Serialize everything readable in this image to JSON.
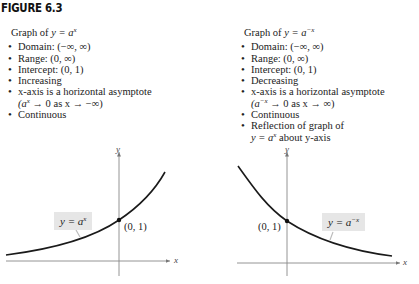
{
  "figure": {
    "title": "FIGURE 6.3"
  },
  "left_panel": {
    "heading_prefix": "Graph of ",
    "heading_eq": "y = a",
    "heading_exp": "x",
    "properties": [
      "Domain:  (−∞, ∞)",
      "Range:  (0, ∞)",
      "Intercept:  (0, 1)",
      "Increasing",
      "x-axis is a horizontal asymptote"
    ],
    "asymptote_note_base": "(a",
    "asymptote_note_exp": "x",
    "asymptote_note_rest": " → 0 as x → −∞)",
    "extra": [
      "Continuous"
    ],
    "graph": {
      "curve_label_eq": "y = a",
      "curve_label_exp": "x",
      "point_label": "(0, 1)",
      "x_axis_label": "x",
      "y_axis_label": "y"
    }
  },
  "right_panel": {
    "heading_prefix": "Graph of ",
    "heading_eq": "y = a",
    "heading_exp": "−x",
    "properties": [
      "Domain:  (−∞, ∞)",
      "Range:  (0, ∞)",
      "Intercept:  (0, 1)",
      "Decreasing",
      "x-axis is a horizontal asymptote"
    ],
    "asymptote_note_base": "(a",
    "asymptote_note_exp": "−x",
    "asymptote_note_rest": " → 0 as x → ∞)",
    "extra": [
      "Continuous",
      "Reflection of graph of"
    ],
    "reflection_cont_eq": "y = a",
    "reflection_cont_exp": "x",
    "reflection_cont_rest": " about y-axis",
    "graph": {
      "curve_label_eq": "y = a",
      "curve_label_exp": "−x",
      "point_label": "(0, 1)",
      "x_axis_label": "x",
      "y_axis_label": "y"
    }
  },
  "colors": {
    "curve": "#1a1a1a",
    "axis": "#777777",
    "label_bg": "#e6e6e6",
    "text": "#222222"
  }
}
